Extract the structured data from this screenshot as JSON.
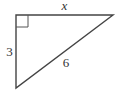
{
  "figure": {
    "type": "right-triangle",
    "vertices": {
      "right_angle": [
        16,
        15
      ],
      "top_right": [
        113,
        15
      ],
      "bottom": [
        16,
        88
      ]
    },
    "right_angle_marker_size": 12,
    "stroke_color": "#444444",
    "labels": {
      "top_side": "x",
      "left_side": "3",
      "hypotenuse": "6"
    }
  }
}
